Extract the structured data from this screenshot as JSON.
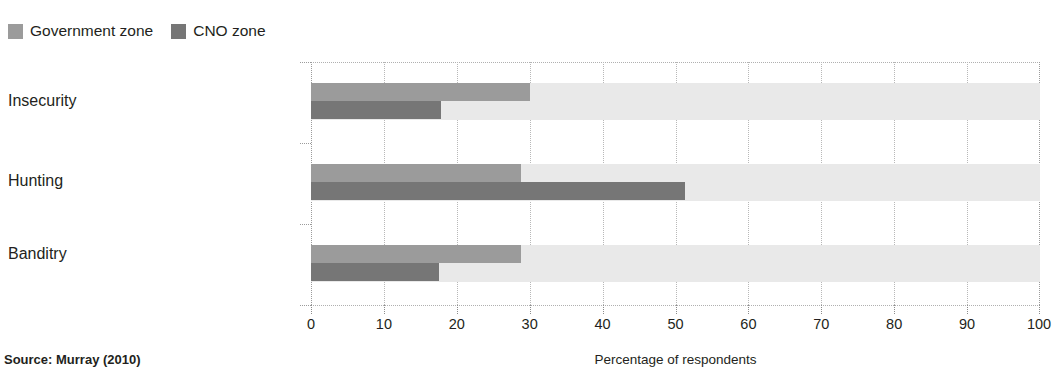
{
  "legend": {
    "position": "top-left",
    "items": [
      {
        "label": "Government zone",
        "color": "#9b9b9b",
        "swatch_name": "legend-swatch-government-zone"
      },
      {
        "label": "CNO zone",
        "color": "#767676",
        "swatch_name": "legend-swatch-cno-zone"
      }
    ]
  },
  "footer": {
    "source": "Source: Murray (2010)"
  },
  "chart_data": {
    "type": "bar",
    "orientation": "horizontal",
    "title": "",
    "subtitle": "",
    "xlabel": "Percentage of respondents",
    "ylabel": "",
    "xlim": [
      0,
      100
    ],
    "xticks": [
      0,
      10,
      20,
      30,
      40,
      50,
      60,
      70,
      80,
      90,
      100
    ],
    "xtick_labels": [
      "0",
      "10",
      "20",
      "30",
      "40",
      "50",
      "60",
      "70",
      "80",
      "90",
      "100"
    ],
    "grid": "vertical-dotted",
    "legend_position": "top-left",
    "categories": [
      "Insecurity",
      "Hunting",
      "Banditry"
    ],
    "series": [
      {
        "name": "Government zone",
        "color": "#9b9b9b",
        "values": [
          30.0,
          28.8,
          28.8
        ]
      },
      {
        "name": "CNO zone",
        "color": "#767676",
        "values": [
          17.8,
          51.3,
          17.5
        ]
      }
    ],
    "annotations": []
  }
}
